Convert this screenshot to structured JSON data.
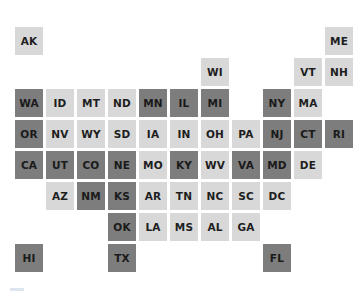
{
  "title": "",
  "colors": {
    "light": "#d8d8d8",
    "dark": "#7d7d7d",
    "text": "#1e1e1e"
  },
  "grid": {
    "origin_x": 15,
    "origin_y": 27,
    "pitch_x": 31,
    "pitch_y": 31,
    "tile": 28
  },
  "states": [
    {
      "abbr": "AK",
      "col": 0,
      "row": 0,
      "shade": "light"
    },
    {
      "abbr": "ME",
      "col": 10,
      "row": 0,
      "shade": "light"
    },
    {
      "abbr": "WI",
      "col": 6,
      "row": 1,
      "shade": "light"
    },
    {
      "abbr": "VT",
      "col": 9,
      "row": 1,
      "shade": "light"
    },
    {
      "abbr": "NH",
      "col": 10,
      "row": 1,
      "shade": "light"
    },
    {
      "abbr": "WA",
      "col": 0,
      "row": 2,
      "shade": "dark"
    },
    {
      "abbr": "ID",
      "col": 1,
      "row": 2,
      "shade": "light"
    },
    {
      "abbr": "MT",
      "col": 2,
      "row": 2,
      "shade": "light"
    },
    {
      "abbr": "ND",
      "col": 3,
      "row": 2,
      "shade": "light"
    },
    {
      "abbr": "MN",
      "col": 4,
      "row": 2,
      "shade": "dark"
    },
    {
      "abbr": "IL",
      "col": 5,
      "row": 2,
      "shade": "dark"
    },
    {
      "abbr": "MI",
      "col": 6,
      "row": 2,
      "shade": "dark"
    },
    {
      "abbr": "NY",
      "col": 8,
      "row": 2,
      "shade": "dark"
    },
    {
      "abbr": "MA",
      "col": 9,
      "row": 2,
      "shade": "light"
    },
    {
      "abbr": "OR",
      "col": 0,
      "row": 3,
      "shade": "dark"
    },
    {
      "abbr": "NV",
      "col": 1,
      "row": 3,
      "shade": "light"
    },
    {
      "abbr": "WY",
      "col": 2,
      "row": 3,
      "shade": "light"
    },
    {
      "abbr": "SD",
      "col": 3,
      "row": 3,
      "shade": "light"
    },
    {
      "abbr": "IA",
      "col": 4,
      "row": 3,
      "shade": "light"
    },
    {
      "abbr": "IN",
      "col": 5,
      "row": 3,
      "shade": "light"
    },
    {
      "abbr": "OH",
      "col": 6,
      "row": 3,
      "shade": "light"
    },
    {
      "abbr": "PA",
      "col": 7,
      "row": 3,
      "shade": "light"
    },
    {
      "abbr": "NJ",
      "col": 8,
      "row": 3,
      "shade": "dark"
    },
    {
      "abbr": "CT",
      "col": 9,
      "row": 3,
      "shade": "dark"
    },
    {
      "abbr": "RI",
      "col": 10,
      "row": 3,
      "shade": "dark"
    },
    {
      "abbr": "CA",
      "col": 0,
      "row": 4,
      "shade": "dark"
    },
    {
      "abbr": "UT",
      "col": 1,
      "row": 4,
      "shade": "dark"
    },
    {
      "abbr": "CO",
      "col": 2,
      "row": 4,
      "shade": "dark"
    },
    {
      "abbr": "NE",
      "col": 3,
      "row": 4,
      "shade": "dark"
    },
    {
      "abbr": "MO",
      "col": 4,
      "row": 4,
      "shade": "light"
    },
    {
      "abbr": "KY",
      "col": 5,
      "row": 4,
      "shade": "dark"
    },
    {
      "abbr": "WV",
      "col": 6,
      "row": 4,
      "shade": "light"
    },
    {
      "abbr": "VA",
      "col": 7,
      "row": 4,
      "shade": "dark"
    },
    {
      "abbr": "MD",
      "col": 8,
      "row": 4,
      "shade": "dark"
    },
    {
      "abbr": "DE",
      "col": 9,
      "row": 4,
      "shade": "light"
    },
    {
      "abbr": "AZ",
      "col": 1,
      "row": 5,
      "shade": "light"
    },
    {
      "abbr": "NM",
      "col": 2,
      "row": 5,
      "shade": "dark"
    },
    {
      "abbr": "KS",
      "col": 3,
      "row": 5,
      "shade": "dark"
    },
    {
      "abbr": "AR",
      "col": 4,
      "row": 5,
      "shade": "light"
    },
    {
      "abbr": "TN",
      "col": 5,
      "row": 5,
      "shade": "light"
    },
    {
      "abbr": "NC",
      "col": 6,
      "row": 5,
      "shade": "light"
    },
    {
      "abbr": "SC",
      "col": 7,
      "row": 5,
      "shade": "light"
    },
    {
      "abbr": "DC",
      "col": 8,
      "row": 5,
      "shade": "light"
    },
    {
      "abbr": "OK",
      "col": 3,
      "row": 6,
      "shade": "dark"
    },
    {
      "abbr": "LA",
      "col": 4,
      "row": 6,
      "shade": "light"
    },
    {
      "abbr": "MS",
      "col": 5,
      "row": 6,
      "shade": "light"
    },
    {
      "abbr": "AL",
      "col": 6,
      "row": 6,
      "shade": "light"
    },
    {
      "abbr": "GA",
      "col": 7,
      "row": 6,
      "shade": "light"
    },
    {
      "abbr": "HI",
      "col": 0,
      "row": 7,
      "shade": "dark"
    },
    {
      "abbr": "TX",
      "col": 3,
      "row": 7,
      "shade": "dark"
    },
    {
      "abbr": "FL",
      "col": 8,
      "row": 7,
      "shade": "dark"
    }
  ]
}
